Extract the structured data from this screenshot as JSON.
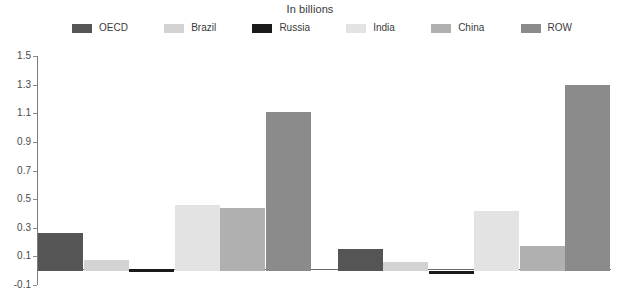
{
  "title": "In billions",
  "legend": {
    "items": [
      {
        "label": "OECD",
        "color": "#555555"
      },
      {
        "label": "Brazil",
        "color": "#d3d3d3"
      },
      {
        "label": "Russia",
        "color": "#1a1a1a"
      },
      {
        "label": "India",
        "color": "#e3e3e3"
      },
      {
        "label": "China",
        "color": "#b0b0b0"
      },
      {
        "label": "ROW",
        "color": "#8b8b8b"
      }
    ]
  },
  "axis": {
    "tick_labels": [
      "1.5",
      "1.3",
      "1.1",
      "0.9",
      "0.7",
      "0.5",
      "0.3",
      "0.1",
      "-0.1"
    ]
  },
  "chart_data": {
    "type": "bar",
    "title": "In billions",
    "xlabel": "",
    "ylabel": "",
    "ylim": [
      -0.1,
      1.5
    ],
    "ytick_step": 0.2,
    "yticks": [
      -0.1,
      0.1,
      0.3,
      0.5,
      0.7,
      0.9,
      1.1,
      1.3,
      1.5
    ],
    "grid": false,
    "legend_position": "top",
    "categories": [
      "Group 1",
      "Group 2"
    ],
    "series": [
      {
        "name": "OECD",
        "color": "#555555",
        "values": [
          0.26,
          0.15
        ]
      },
      {
        "name": "Brazil",
        "color": "#d3d3d3",
        "values": [
          0.075,
          0.06
        ]
      },
      {
        "name": "Russia",
        "color": "#1a1a1a",
        "values": [
          0.01,
          -0.02
        ]
      },
      {
        "name": "India",
        "color": "#e3e3e3",
        "values": [
          0.46,
          0.42
        ]
      },
      {
        "name": "China",
        "color": "#b0b0b0",
        "values": [
          0.44,
          0.17
        ]
      },
      {
        "name": "ROW",
        "color": "#8b8b8b",
        "values": [
          1.11,
          1.3
        ]
      }
    ]
  }
}
